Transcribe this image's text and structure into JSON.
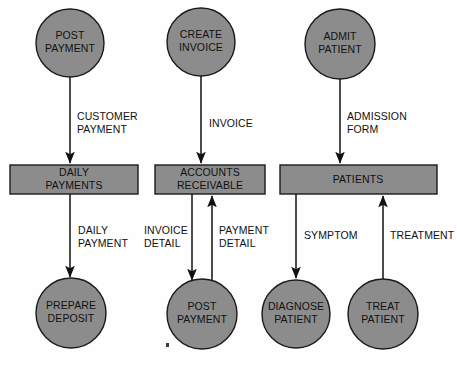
{
  "diagram": {
    "colors": {
      "node_fill": "#8c8c8c",
      "node_stroke": "#1a1a1a",
      "line": "#111111",
      "text": "#111111",
      "background": "#fefefe"
    },
    "processes": [
      {
        "id": "post-payment-top",
        "line1": "POST",
        "line2": "PAYMENT",
        "cx": 70,
        "cy": 43,
        "r": 34
      },
      {
        "id": "create-invoice",
        "line1": "CREATE",
        "line2": "INVOICE",
        "cx": 201,
        "cy": 42,
        "r": 34
      },
      {
        "id": "admit-patient",
        "line1": "ADMIT",
        "line2": "PATIENT",
        "cx": 340,
        "cy": 44,
        "r": 35
      },
      {
        "id": "prepare-deposit",
        "line1": "PREPARE",
        "line2": "DEPOSIT",
        "cx": 71,
        "cy": 313,
        "r": 35
      },
      {
        "id": "post-payment-bottom",
        "line1": "POST",
        "line2": "PAYMENT",
        "cx": 202,
        "cy": 314,
        "r": 35
      },
      {
        "id": "diagnose-patient",
        "line1": "DIAGNOSE",
        "line2": "PATIENT",
        "cx": 296,
        "cy": 314,
        "r": 34
      },
      {
        "id": "treat-patient",
        "line1": "TREAT",
        "line2": "PATIENT",
        "cx": 383,
        "cy": 314,
        "r": 35
      }
    ],
    "data_stores": [
      {
        "id": "daily-payments",
        "line1": "DAILY",
        "line2": "PAYMENTS",
        "x": 10,
        "y": 165,
        "w": 128,
        "h": 29
      },
      {
        "id": "accounts-receivable",
        "line1": "ACCOUNTS",
        "line2": "RECEIVABLE",
        "x": 155,
        "y": 165,
        "w": 110,
        "h": 29
      },
      {
        "id": "patients",
        "line1": "PATIENTS",
        "line2": "",
        "x": 280,
        "y": 165,
        "w": 157,
        "h": 29
      }
    ],
    "flows": [
      {
        "id": "customer-payment",
        "line1": "CUSTOMER",
        "line2": "PAYMENT",
        "label_x": 77,
        "label_y": 120,
        "from": "post-payment-top",
        "to": "daily-payments"
      },
      {
        "id": "invoice",
        "line1": "INVOICE",
        "line2": "",
        "label_x": 209,
        "label_y": 124,
        "from": "create-invoice",
        "to": "accounts-receivable"
      },
      {
        "id": "admission-form",
        "line1": "ADMISSION",
        "line2": "FORM",
        "label_x": 347,
        "label_y": 120,
        "from": "admit-patient",
        "to": "patients"
      },
      {
        "id": "daily-payment",
        "line1": "DAILY",
        "line2": "PAYMENT",
        "label_x": 78,
        "label_y": 234,
        "from": "daily-payments",
        "to": "prepare-deposit"
      },
      {
        "id": "invoice-detail",
        "line1": "INVOICE",
        "line2": "DETAIL",
        "label_x": 144,
        "label_y": 234,
        "from": "accounts-receivable",
        "to": "post-payment-bottom"
      },
      {
        "id": "payment-detail",
        "line1": "PAYMENT",
        "line2": "DETAIL",
        "label_x": 218,
        "label_y": 234,
        "from": "post-payment-bottom",
        "to": "accounts-receivable"
      },
      {
        "id": "symptom",
        "line1": "SYMPTOM",
        "line2": "",
        "label_x": 304,
        "label_y": 239,
        "from": "patients",
        "to": "diagnose-patient"
      },
      {
        "id": "treatment",
        "line1": "TREATMENT",
        "line2": "",
        "label_x": 389,
        "label_y": 239,
        "from": "treat-patient",
        "to": "patients"
      }
    ]
  }
}
